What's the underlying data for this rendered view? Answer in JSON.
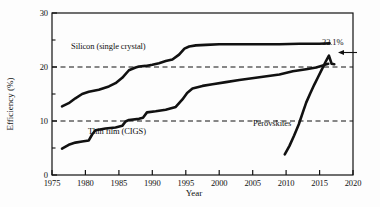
{
  "chart_data": {
    "type": "line",
    "title": "",
    "xlabel": "Year",
    "ylabel": "Efficiency (%)",
    "xlim": [
      1975,
      2020
    ],
    "ylim": [
      0,
      30
    ],
    "xticks": [
      1975,
      1980,
      1985,
      1990,
      1995,
      2000,
      2005,
      2010,
      2015,
      2020
    ],
    "xtick_labels": [
      "1975",
      "1980",
      "1985",
      "1990",
      "1995",
      "2000",
      "2005",
      "2010",
      "2015",
      "2020"
    ],
    "yticks": [
      0,
      10,
      20,
      30
    ],
    "ytick_labels": [
      "0",
      "10",
      "20",
      "30"
    ],
    "yminor_ticks": [
      5,
      15,
      25
    ],
    "grid": false,
    "reference_lines": [
      {
        "name": "10-percent-dashed",
        "y": 10,
        "style": "dashed"
      },
      {
        "name": "20-percent-dashed",
        "y": 20,
        "style": "dashed"
      }
    ],
    "legend_position": "inline-annotations",
    "annotations": [
      {
        "name": "peak-efficiency",
        "text": "22.1%",
        "x": 2016,
        "y": 22.1,
        "arrow": "left"
      }
    ],
    "series": [
      {
        "name": "Silicon (single crystal)",
        "label": "Silicon (single crystal)",
        "color": "#111111",
        "x": [
          1976.5,
          1977.5,
          1978.5,
          1979.5,
          1980.5,
          1982.0,
          1983.5,
          1984.5,
          1985.5,
          1986.5,
          1987.5,
          1988.0,
          1989.0,
          1990.0,
          1991.0,
          1992.0,
          1993.0,
          1994.0,
          1994.8,
          1995.5,
          1996.5,
          1998.0,
          2000.0,
          2003.0,
          2006.0,
          2009.0,
          2012.0,
          2015.0,
          2016.5
        ],
        "y": [
          12.7,
          13.3,
          14.2,
          15.0,
          15.4,
          15.8,
          16.4,
          17.0,
          18.0,
          19.4,
          19.9,
          20.1,
          20.2,
          20.4,
          20.7,
          21.1,
          21.4,
          22.3,
          23.4,
          23.8,
          24.0,
          24.1,
          24.2,
          24.2,
          24.2,
          24.2,
          24.3,
          24.3,
          24.4
        ]
      },
      {
        "name": "Thin film (CIGS)",
        "label": "Thin film (CIGS)",
        "color": "#111111",
        "x": [
          1976.5,
          1977.5,
          1978.5,
          1979.5,
          1980.5,
          1981.0,
          1981.5,
          1983.0,
          1984.5,
          1985.5,
          1986.0,
          1986.5,
          1988.0,
          1988.6,
          1989.2,
          1990.5,
          1992.0,
          1993.5,
          1994.5,
          1995.2,
          1996.0,
          1997.5,
          1999.0,
          2001.0,
          2003.0,
          2006.0,
          2009.0,
          2011.0,
          2013.0,
          2014.5,
          2015.5,
          2016.3
        ],
        "y": [
          4.9,
          5.6,
          6.0,
          6.2,
          6.4,
          7.5,
          8.3,
          8.6,
          8.8,
          9.1,
          9.9,
          10.2,
          10.4,
          10.6,
          11.6,
          11.8,
          12.1,
          12.6,
          14.0,
          15.2,
          16.0,
          16.5,
          16.8,
          17.2,
          17.6,
          18.1,
          18.6,
          19.2,
          19.6,
          19.9,
          20.3,
          20.6
        ]
      },
      {
        "name": "Perovskites",
        "label": "Perovskites",
        "color": "#111111",
        "x": [
          2009.8,
          2010.5,
          2011.2,
          2011.9,
          2012.5,
          2013.0,
          2013.6,
          2014.2,
          2014.8,
          2015.4,
          2016.0,
          2016.4,
          2016.8,
          2017.2
        ],
        "y": [
          3.8,
          5.4,
          7.3,
          9.4,
          11.6,
          13.4,
          15.1,
          16.7,
          18.2,
          19.7,
          21.2,
          22.1,
          20.6,
          20.5
        ]
      }
    ]
  },
  "axes": {
    "y_title": "Efficiency (%)",
    "x_title": "Year"
  },
  "labels": {
    "silicon": "Silicon (single crystal)",
    "thin_film": "Thin film (CIGS)",
    "perovskites": "Perovskites",
    "peak_value": "22.1%"
  },
  "colors": {
    "line": "#111111",
    "axis": "#111111",
    "dashed_reference": "#111111",
    "background": "#fdfdfd"
  }
}
